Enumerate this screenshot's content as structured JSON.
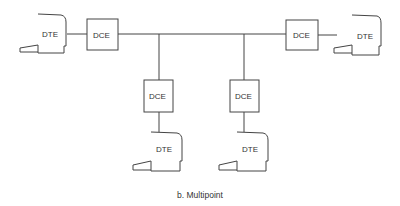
{
  "diagram": {
    "caption": "b. Multipoint",
    "nodes": [
      {
        "id": "dte-left",
        "type": "DTE",
        "label": "DTE"
      },
      {
        "id": "dce-left",
        "type": "DCE",
        "label": "DCE"
      },
      {
        "id": "dce-right",
        "type": "DCE",
        "label": "DCE"
      },
      {
        "id": "dte-right",
        "type": "DTE",
        "label": "DTE"
      },
      {
        "id": "dce-bottom-left",
        "type": "DCE",
        "label": "DCE"
      },
      {
        "id": "dte-bottom-left",
        "type": "DTE",
        "label": "DTE"
      },
      {
        "id": "dce-bottom-right",
        "type": "DCE",
        "label": "DCE"
      },
      {
        "id": "dte-bottom-right",
        "type": "DTE",
        "label": "DTE"
      }
    ],
    "edges": [
      [
        "dte-left",
        "dce-left"
      ],
      [
        "dce-left",
        "bus"
      ],
      [
        "bus",
        "dce-right"
      ],
      [
        "dce-right",
        "dte-right"
      ],
      [
        "bus",
        "dce-bottom-left"
      ],
      [
        "dce-bottom-left",
        "dte-bottom-left"
      ],
      [
        "bus",
        "dce-bottom-right"
      ],
      [
        "dce-bottom-right",
        "dte-bottom-right"
      ]
    ]
  }
}
